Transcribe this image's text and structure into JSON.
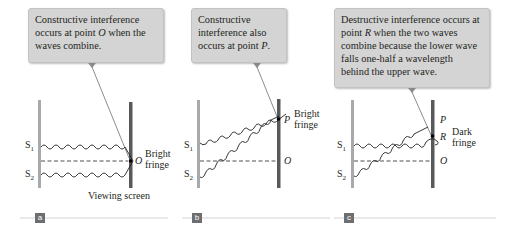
{
  "panels": [
    {
      "id": "a",
      "tag": "a",
      "callout": {
        "pre": "Constructive interference occurs at point ",
        "point": "O",
        "post": " when the waves combine."
      },
      "labels": {
        "s1": "S",
        "s1_sub": "1",
        "s2": "S",
        "s2_sub": "2",
        "o": "O",
        "fringe_line1": "Bright",
        "fringe_line2": "fringe",
        "screen": "Viewing screen"
      }
    },
    {
      "id": "b",
      "tag": "b",
      "callout": {
        "pre": "Constructive interference also occurs at point ",
        "point": "P",
        "post": "."
      },
      "labels": {
        "s1": "S",
        "s1_sub": "1",
        "s2": "S",
        "s2_sub": "2",
        "o": "O",
        "p": "P",
        "fringe_line1": "Bright",
        "fringe_line2": "fringe"
      }
    },
    {
      "id": "c",
      "tag": "c",
      "callout": {
        "pre": "Destructive interference occurs at point ",
        "point": "R",
        "post": " when the two waves combine because the lower wave falls one-half a wavelength behind the upper wave."
      },
      "labels": {
        "s1": "S",
        "s1_sub": "1",
        "s2": "S",
        "s2_sub": "2",
        "o": "O",
        "p": "P",
        "r": "R",
        "fringe_line1": "Dark",
        "fringe_line2": "fringe"
      }
    }
  ],
  "colors": {
    "callout_bg": "#d4d4d4",
    "barrier": "#a7a9ac",
    "screen": "#58595b",
    "tag_bg": "#6d6e71",
    "rule": "#c8c8c8"
  }
}
